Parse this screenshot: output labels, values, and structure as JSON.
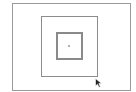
{
  "canvas": {
    "background": "#ffffff",
    "shapes": [
      {
        "name": "outer-rectangle",
        "x": 12,
        "y": 3,
        "width": 119,
        "height": 88,
        "stroke": "#9a9a9a",
        "stroke_width": 1
      },
      {
        "name": "middle-rectangle",
        "x": 41,
        "y": 16,
        "width": 57,
        "height": 61,
        "stroke": "#8c8c8c",
        "stroke_width": 1
      },
      {
        "name": "inner-square",
        "x": 56,
        "y": 32,
        "width": 27,
        "height": 28,
        "stroke": "#8a8a8a",
        "stroke_width": 2
      },
      {
        "name": "center-dot",
        "x": 68,
        "y": 45,
        "size": 2,
        "fill": "#b0b0b0"
      }
    ]
  },
  "cursor": {
    "icon": "arrow-pointer-icon",
    "x": 95,
    "y": 74,
    "color": "#222222"
  }
}
